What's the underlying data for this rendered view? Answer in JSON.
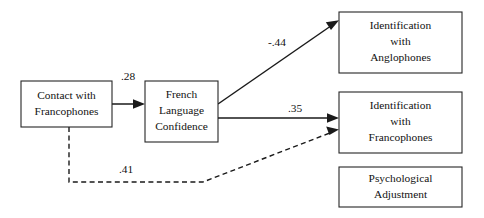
{
  "diagram": {
    "type": "path-diagram",
    "title": "",
    "background_color": "#ffffff",
    "line_color": "#1a1a1a",
    "box_border_color": "#262626",
    "text_color": "#111111",
    "nodes": [
      {
        "id": "contact",
        "lines": [
          "Contact with",
          "Francophones"
        ],
        "line1": "Contact with",
        "line2": "Francophones",
        "line3": "",
        "x": 21,
        "y": 81,
        "width": 91,
        "height": 46
      },
      {
        "id": "confidence",
        "lines": [
          "French",
          "Language",
          "Confidence"
        ],
        "line1": "French",
        "line2": "Language",
        "line3": "Confidence",
        "x": 145,
        "y": 81,
        "width": 73,
        "height": 61
      },
      {
        "id": "id_anglophones",
        "lines": [
          "Identification",
          "with",
          "Anglophones"
        ],
        "line1": "Identification",
        "line2": "with",
        "line3": "Anglophones",
        "x": 339,
        "y": 12,
        "width": 123,
        "height": 61
      },
      {
        "id": "id_francophones",
        "lines": [
          "Identification",
          "with",
          "Francophones"
        ],
        "line1": "Identification",
        "line2": "with",
        "line3": "Francophones",
        "x": 339,
        "y": 92,
        "width": 123,
        "height": 61
      },
      {
        "id": "psych_adjustment",
        "lines": [
          "Psychological",
          "Adjustment"
        ],
        "line1": "Psychological",
        "line2": "Adjustment",
        "line3": "",
        "x": 339,
        "y": 167,
        "width": 123,
        "height": 40
      }
    ],
    "paths": [
      {
        "id": "contact-to-confidence",
        "from": "contact",
        "to": "confidence",
        "coefficient": ".28",
        "style": "solid",
        "label_x": 128,
        "label_y": 77
      },
      {
        "id": "confidence-to-anglophones",
        "from": "confidence",
        "to": "id_anglophones",
        "coefficient": "-.44",
        "style": "solid",
        "label_x": 277,
        "label_y": 43
      },
      {
        "id": "confidence-to-francophones",
        "from": "confidence",
        "to": "id_francophones",
        "coefficient": ".35",
        "style": "solid",
        "label_x": 295,
        "label_y": 109
      },
      {
        "id": "contact-to-francophones",
        "from": "contact",
        "to": "id_francophones",
        "coefficient": ".41",
        "style": "dashed",
        "label_x": 126,
        "label_y": 170
      }
    ]
  }
}
